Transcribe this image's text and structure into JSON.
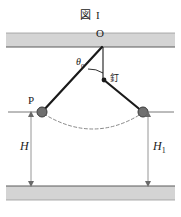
{
  "figure": {
    "title": "図 I",
    "caption_lang": "ja",
    "labels": {
      "pivot": "O",
      "angle": "θ",
      "angle_sub": "0",
      "nail": "釘",
      "bob_left": "P",
      "height_left": "H",
      "height_right": "H",
      "height_right_sub": "1"
    },
    "colors": {
      "ink": "#1a1a1a",
      "bar_fill": "#d4d4d4",
      "bar_stroke": "#9a9a9a",
      "string": "#1a1a1a",
      "bob_fill": "#707070",
      "bob_stroke": "#3a3a3a",
      "dim_line": "#8a8a8a",
      "arc_dashed": "#8a8a8a",
      "background": "#ffffff"
    },
    "geometry": {
      "pivot": {
        "x": 102,
        "y": 47
      },
      "nail": {
        "x": 104,
        "y": 80
      },
      "bob_left": {
        "x": 42,
        "y": 112
      },
      "bob_right": {
        "x": 143,
        "y": 112
      },
      "bob_radius": 5,
      "nail_radius": 2.2,
      "ceiling": {
        "x": 6,
        "y": 33,
        "w": 169,
        "h": 14
      },
      "floor": {
        "x": 6,
        "y": 186,
        "w": 169,
        "h": 14
      },
      "dim_left_x": 31,
      "dim_right_x": 148,
      "dim_top_y": 112,
      "dim_bottom_y": 186,
      "angle_arc_radius": 26,
      "swing_arc_low_y": 131
    }
  }
}
